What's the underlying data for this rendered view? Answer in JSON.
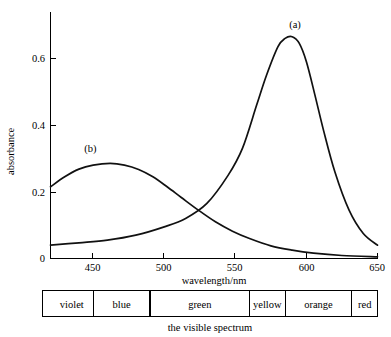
{
  "chart_data": {
    "type": "line",
    "title": "",
    "xlabel": "wavelength/nm",
    "ylabel": "absorbance",
    "xlim": [
      420,
      650
    ],
    "ylim": [
      0,
      0.72
    ],
    "grid": false,
    "legend_position": "inline-annotations",
    "xticks": [
      450,
      500,
      550,
      600,
      650
    ],
    "xtick_labels": [
      "450",
      "500",
      "550",
      "600",
      "650"
    ],
    "yticks": [
      0,
      0.2,
      0.4,
      0.6
    ],
    "ytick_labels": [
      "0",
      "0.2",
      "0.4",
      "0.6"
    ],
    "annotations": [
      {
        "text": "(a)",
        "x": 592,
        "y": 0.69
      },
      {
        "text": "(b)",
        "x": 448,
        "y": 0.32
      }
    ],
    "series": [
      {
        "name": "(a)",
        "label": "(a)",
        "color": "#111111",
        "peak_x": 590,
        "peak_y": 0.665,
        "x": [
          420,
          440,
          460,
          480,
          500,
          515,
          530,
          545,
          555,
          565,
          572,
          580,
          585,
          590,
          595,
          600,
          606,
          612,
          620,
          630,
          640,
          650
        ],
        "y": [
          0.04,
          0.047,
          0.055,
          0.07,
          0.095,
          0.12,
          0.165,
          0.25,
          0.33,
          0.46,
          0.55,
          0.635,
          0.66,
          0.665,
          0.645,
          0.59,
          0.49,
          0.385,
          0.26,
          0.145,
          0.075,
          0.04
        ]
      },
      {
        "name": "(b)",
        "label": "(b)",
        "color": "#111111",
        "peak_x": 462,
        "peak_y": 0.285,
        "x": [
          420,
          430,
          440,
          450,
          462,
          472,
          482,
          492,
          502,
          512,
          524,
          536,
          548,
          560,
          575,
          590,
          605,
          625,
          650
        ],
        "y": [
          0.215,
          0.245,
          0.268,
          0.28,
          0.285,
          0.28,
          0.267,
          0.245,
          0.215,
          0.183,
          0.145,
          0.11,
          0.082,
          0.06,
          0.038,
          0.025,
          0.016,
          0.009,
          0.005
        ]
      }
    ],
    "crossing_point": {
      "x": 500,
      "y": 0.215
    }
  },
  "spectrum_bar": {
    "caption": "the visible spectrum",
    "bands": [
      {
        "label": "violet",
        "start_nm": 420,
        "end_nm": 450
      },
      {
        "label": "blue",
        "start_nm": 450,
        "end_nm": 490
      },
      {
        "label": "green",
        "start_nm": 490,
        "end_nm": 560
      },
      {
        "label": "yellow",
        "start_nm": 560,
        "end_nm": 585
      },
      {
        "label": "orange",
        "start_nm": 585,
        "end_nm": 632
      },
      {
        "label": "red",
        "start_nm": 632,
        "end_nm": 650
      }
    ]
  }
}
